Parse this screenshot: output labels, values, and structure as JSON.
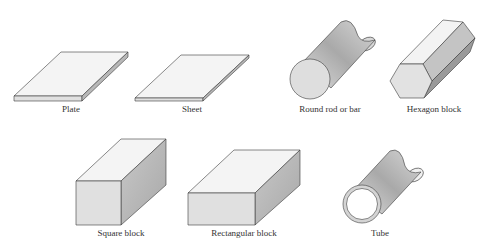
{
  "figure": {
    "shapes": [
      {
        "id": "plate",
        "label": "Plate",
        "label_x": 71,
        "label_y": 104
      },
      {
        "id": "sheet",
        "label": "Sheet",
        "label_x": 192,
        "label_y": 104
      },
      {
        "id": "round-rod",
        "label": "Round rod or bar",
        "label_x": 330,
        "label_y": 104
      },
      {
        "id": "hexagon-block",
        "label": "Hexagon block",
        "label_x": 434,
        "label_y": 104
      },
      {
        "id": "square-block",
        "label": "Square block",
        "label_x": 121,
        "label_y": 228
      },
      {
        "id": "rectangular-block",
        "label": "Rectangular block",
        "label_x": 244,
        "label_y": 228
      },
      {
        "id": "tube",
        "label": "Tube",
        "label_x": 380,
        "label_y": 228
      }
    ],
    "colors": {
      "outline": "#3a3a3a",
      "top_face": "#f4f4f4",
      "front_face": "#e0e0e0",
      "side_face": "#bdbdbd"
    }
  }
}
